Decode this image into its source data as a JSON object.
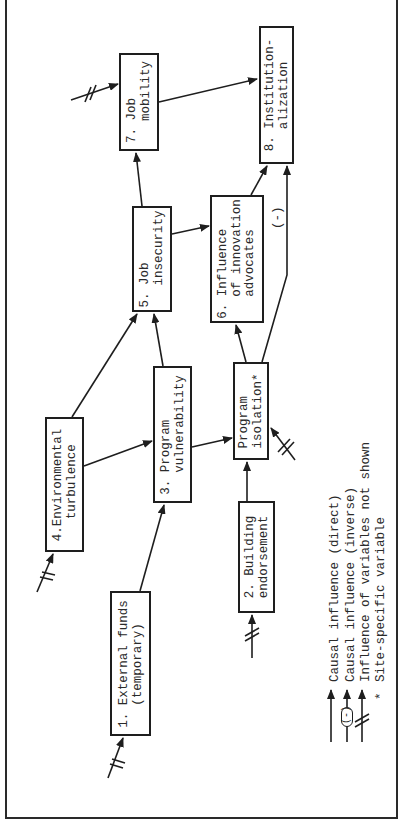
{
  "diagram": {
    "orientation": "rotated 90° counter-clockwise",
    "nodes": [
      {
        "id": "1",
        "line1": "1. External funds",
        "line2": "(temporary)"
      },
      {
        "id": "2",
        "line1": "2. Building",
        "line2": "endorsement"
      },
      {
        "id": "3",
        "line1": "3. Program",
        "line2": "vulnerability"
      },
      {
        "id": "4",
        "line1": "4.Environmental",
        "line2": "turbulence"
      },
      {
        "id": "5",
        "line1": "5. Job",
        "line2": "insecurity"
      },
      {
        "id": "6",
        "line1": "6. Influence",
        "line2": "of innovation",
        "line3": "advocates"
      },
      {
        "id": "7",
        "line1": "7. Job",
        "line2": "mobility"
      },
      {
        "id": "8",
        "line1": "8. Institution-",
        "line2": "alization"
      },
      {
        "id": "iso",
        "line1": "Program",
        "line2": "isolation*"
      }
    ],
    "edges": [
      {
        "from": "1",
        "to": "3",
        "type": "direct"
      },
      {
        "from": "4",
        "to": "3",
        "type": "direct"
      },
      {
        "from": "4",
        "to": "5",
        "type": "direct"
      },
      {
        "from": "3",
        "to": "5",
        "type": "direct"
      },
      {
        "from": "3",
        "to": "iso",
        "type": "direct"
      },
      {
        "from": "2",
        "to": "iso",
        "type": "direct"
      },
      {
        "from": "iso",
        "to": "6",
        "type": "direct"
      },
      {
        "from": "iso",
        "to": "8",
        "type": "inverse"
      },
      {
        "from": "5",
        "to": "6",
        "type": "direct"
      },
      {
        "from": "5",
        "to": "7",
        "type": "direct"
      },
      {
        "from": "6",
        "to": "8",
        "type": "direct"
      },
      {
        "from": "7",
        "to": "8",
        "type": "direct"
      }
    ],
    "external_influences": [
      "1",
      "2",
      "4",
      "7",
      "iso"
    ],
    "inverse_label": "(-)"
  },
  "legend": {
    "items": [
      {
        "symbol": "arrow",
        "label": "Causal influence (direct)"
      },
      {
        "symbol": "arrow-inverse",
        "marker": "(-)",
        "label": "Causal influence (inverse)"
      },
      {
        "symbol": "arrow-slashed",
        "label": "Influence of variables not shown"
      },
      {
        "symbol": "asterisk",
        "marker": "*",
        "label": "Site-specific variable"
      }
    ]
  }
}
